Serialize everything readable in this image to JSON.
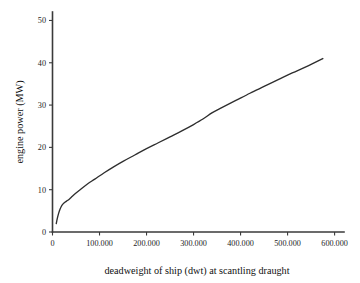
{
  "chart_data": {
    "type": "line",
    "title": "",
    "xlabel": "deadweight of ship (dwt) at scantling draught",
    "ylabel": "engine power (MW)",
    "xlim": [
      0,
      620000
    ],
    "ylim": [
      0,
      52
    ],
    "grid": false,
    "legend": "none",
    "x_ticks": [
      0,
      100000,
      200000,
      300000,
      400000,
      500000,
      600000
    ],
    "x_tick_labels": [
      "0",
      "100.000",
      "200.000",
      "300.000",
      "400.000",
      "500.000",
      "600.000"
    ],
    "y_ticks": [
      0,
      10,
      20,
      30,
      40,
      50
    ],
    "y_tick_labels": [
      "0",
      "10",
      "20",
      "30",
      "40",
      "50"
    ],
    "series": [
      {
        "name": "engine power",
        "color": "#2e2e2e",
        "x": [
          8000,
          10000,
          13000,
          16000,
          20000,
          25000,
          30000,
          35000,
          40000,
          50000,
          60000,
          75000,
          90000,
          110000,
          130000,
          150000,
          175000,
          200000,
          225000,
          250000,
          275000,
          300000,
          320000,
          340000,
          360000,
          390000,
          420000,
          450000,
          480000,
          510000,
          540000,
          575000
        ],
        "y": [
          2.0,
          3.1,
          4.4,
          5.4,
          6.3,
          6.9,
          7.3,
          7.7,
          8.2,
          9.2,
          10.1,
          11.4,
          12.5,
          14.0,
          15.4,
          16.7,
          18.2,
          19.7,
          21.1,
          22.5,
          23.9,
          25.4,
          26.7,
          28.2,
          29.4,
          31.1,
          32.8,
          34.4,
          36.0,
          37.6,
          39.1,
          41.0
        ]
      }
    ]
  },
  "axes": {
    "x_axis_name": "x-axis",
    "y_axis_name": "y-axis"
  }
}
